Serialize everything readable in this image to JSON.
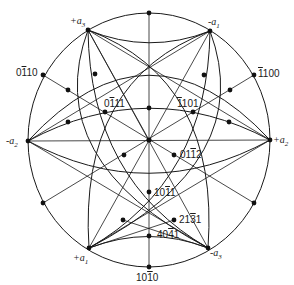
{
  "figure": {
    "type": "stereographic-projection",
    "axis_labels": {
      "plus_a3": {
        "sign": "+",
        "letter": "a",
        "sub": "3"
      },
      "minus_a1": {
        "sign": "-",
        "letter": "a",
        "sub": "1"
      },
      "minus_a2": {
        "sign": "-",
        "letter": "a",
        "sub": "2"
      },
      "plus_a2": {
        "sign": "+",
        "letter": "a",
        "sub": "2"
      },
      "plus_a1": {
        "sign": "+",
        "letter": "a",
        "sub": "1"
      },
      "minus_a3": {
        "sign": "-",
        "letter": "a",
        "sub": "3"
      }
    },
    "pole_labels": {
      "p0110": {
        "pre": "0",
        "bar": "1",
        "post": "10"
      },
      "p1100": {
        "pre": "",
        "bar": "1",
        "post": "100"
      },
      "p0111": {
        "pre": "0",
        "bar": "1",
        "post": "11"
      },
      "p1101": {
        "pre": "",
        "bar": "1",
        "post": "101"
      },
      "p0112": {
        "pre": "01",
        "bar": "1",
        "post": "2"
      },
      "p1011": {
        "pre": "10",
        "bar": "1",
        "post": "1"
      },
      "p2131": {
        "pre": "21",
        "bar": "3",
        "post": "1"
      },
      "p4041": {
        "pre": "40",
        "bar": "4",
        "post": "1"
      },
      "p1010": {
        "pre": "10",
        "bar": "1",
        "post": "0"
      }
    }
  }
}
